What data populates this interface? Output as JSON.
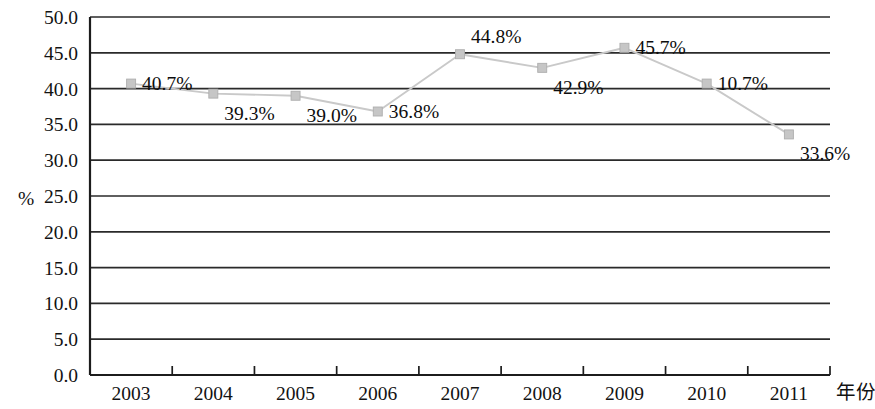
{
  "chart_data": {
    "type": "line",
    "title": "",
    "subtitle": "",
    "xlabel": "年份",
    "ylabel": "%",
    "categories": [
      "2003",
      "2004",
      "2005",
      "2006",
      "2007",
      "2008",
      "2009",
      "2010",
      "2011"
    ],
    "values": [
      40.7,
      39.3,
      39.0,
      36.8,
      44.8,
      42.9,
      45.7,
      40.7,
      33.6
    ],
    "point_labels": [
      "40.7%",
      "39.3%",
      "39.0%",
      "36.8%",
      "44.8%",
      "42.9%",
      "45.7%",
      "10.7%",
      "33.6%"
    ],
    "label_positions": [
      "right",
      "below-right",
      "below-right",
      "right",
      "above-right",
      "below-right",
      "right",
      "right",
      "below-right"
    ],
    "ylim": [
      0.0,
      50.0
    ],
    "ytick_step": 5.0,
    "ytick_labels": [
      "50.0",
      "45.0",
      "40.0",
      "35.0",
      "30.0",
      "25.0",
      "20.0",
      "15.0",
      "10.0",
      "5.0",
      "0.0"
    ],
    "grid": "horizontal",
    "legend": "none",
    "series": [
      {
        "name": "",
        "values": [
          40.7,
          39.3,
          39.0,
          36.8,
          44.8,
          42.9,
          45.7,
          40.7,
          33.6
        ],
        "line_color": "#c9c9c9",
        "marker_color": "#c6c6c6",
        "marker": "square"
      }
    ],
    "colors": {
      "axis": "#1c1c1c",
      "grid": "#2a2a2a",
      "series": "#c9c9c9",
      "marker": "#c6c6c6",
      "text": "#121212",
      "background": "#ffffff"
    }
  }
}
